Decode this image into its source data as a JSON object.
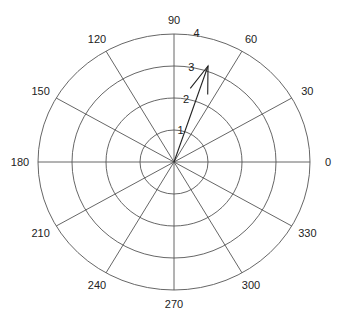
{
  "chart_data": {
    "type": "polar",
    "subtype": "compass",
    "title": "",
    "center_px": [
      174,
      162
    ],
    "radius_px": [
      136,
      128
    ],
    "r_max": 4,
    "r_ticks": [
      1,
      2,
      3,
      4
    ],
    "r_tick_labels": [
      "1",
      "2",
      "3",
      "4"
    ],
    "r_label_angle_deg": 75,
    "theta_ticks": [
      0,
      30,
      60,
      90,
      120,
      150,
      180,
      210,
      240,
      270,
      300,
      330
    ],
    "theta_tick_labels": [
      "0",
      "30",
      "60",
      "90",
      "120",
      "150",
      "180",
      "210",
      "240",
      "270",
      "300",
      "330"
    ],
    "grid": true,
    "series": [
      {
        "name": "arrow",
        "u": 1,
        "v": 3,
        "r": 3.16,
        "theta_deg": 71.6
      }
    ],
    "colors": {
      "grid": "#555555",
      "arrow": "#222222",
      "text": "#222222",
      "background": "#ffffff"
    }
  }
}
